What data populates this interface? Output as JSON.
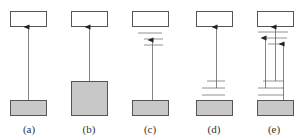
{
  "colors": {
    "stroke": "#555555",
    "fill_top": "#ffffff",
    "fill_bottom": "#c8c8c8",
    "line": "#666666"
  },
  "panels": [
    {
      "id": "a",
      "label": "(a)"
    },
    {
      "id": "b",
      "label": "(b)"
    },
    {
      "id": "c",
      "label": "(c)"
    },
    {
      "id": "d",
      "label": "(d)"
    },
    {
      "id": "e",
      "label": "(e)"
    }
  ]
}
